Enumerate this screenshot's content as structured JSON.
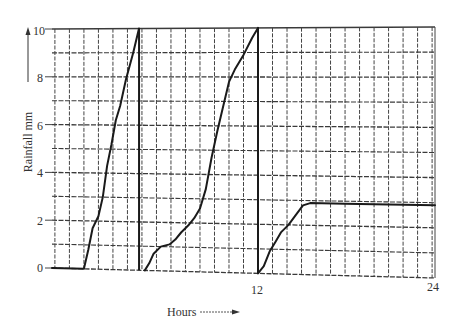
{
  "chart_data": {
    "type": "line",
    "title": "",
    "xlabel": "Hours",
    "ylabel": "Rainfall mm",
    "x_ticks": [
      12,
      24
    ],
    "y_ticks": [
      0,
      2,
      4,
      6,
      8,
      10
    ],
    "xlim": [
      -2.2,
      24.2
    ],
    "ylim": [
      0,
      10
    ],
    "grid": true,
    "legend": null,
    "series": [
      {
        "name": "Trace 1 (siphon cycle 1)",
        "points": [
          [
            -2.2,
            0
          ],
          [
            0,
            0
          ],
          [
            0.3,
            0.8
          ],
          [
            0.6,
            1.7
          ],
          [
            1.0,
            2.2
          ],
          [
            1.3,
            3.0
          ],
          [
            1.6,
            4.3
          ],
          [
            1.9,
            5.2
          ],
          [
            2.2,
            6.2
          ],
          [
            2.5,
            6.8
          ],
          [
            2.9,
            7.9
          ],
          [
            3.4,
            9.0
          ],
          [
            3.8,
            10.0
          ]
        ]
      },
      {
        "name": "Trace 2 (siphon cycle 2)",
        "points": [
          [
            4.2,
            0
          ],
          [
            4.5,
            0.3
          ],
          [
            4.8,
            0.7
          ],
          [
            5.3,
            1.0
          ],
          [
            5.9,
            1.1
          ],
          [
            6.3,
            1.3
          ],
          [
            6.7,
            1.6
          ],
          [
            7.2,
            1.9
          ],
          [
            7.6,
            2.2
          ],
          [
            8.0,
            2.6
          ],
          [
            8.4,
            3.4
          ],
          [
            8.8,
            4.7
          ],
          [
            9.2,
            5.8
          ],
          [
            9.6,
            6.8
          ],
          [
            10.0,
            7.8
          ],
          [
            10.4,
            8.3
          ],
          [
            11.0,
            8.9
          ],
          [
            11.6,
            9.6
          ],
          [
            12.0,
            10.0
          ]
        ]
      },
      {
        "name": "Trace 3 (siphon cycle 3)",
        "points": [
          [
            12.0,
            0
          ],
          [
            12.4,
            0.3
          ],
          [
            12.8,
            0.9
          ],
          [
            13.2,
            1.3
          ],
          [
            13.6,
            1.7
          ],
          [
            14.1,
            2.0
          ],
          [
            14.6,
            2.4
          ],
          [
            15.1,
            2.8
          ],
          [
            15.6,
            2.9
          ],
          [
            18,
            2.9
          ],
          [
            21,
            2.9
          ],
          [
            24.2,
            2.9
          ]
        ]
      }
    ],
    "siphon_drops_at_hours": [
      3.8,
      12.0
    ],
    "annotations": [
      "Rainfall mm arrow (up)",
      "Hours arrow (right)"
    ]
  },
  "labels": {
    "y_axis_title": "Rainfall mm",
    "x_axis_title": "Hours",
    "y_ticks": [
      "0",
      "2",
      "4",
      "6",
      "8",
      "10"
    ],
    "x_ticks": [
      "12",
      "24"
    ]
  }
}
